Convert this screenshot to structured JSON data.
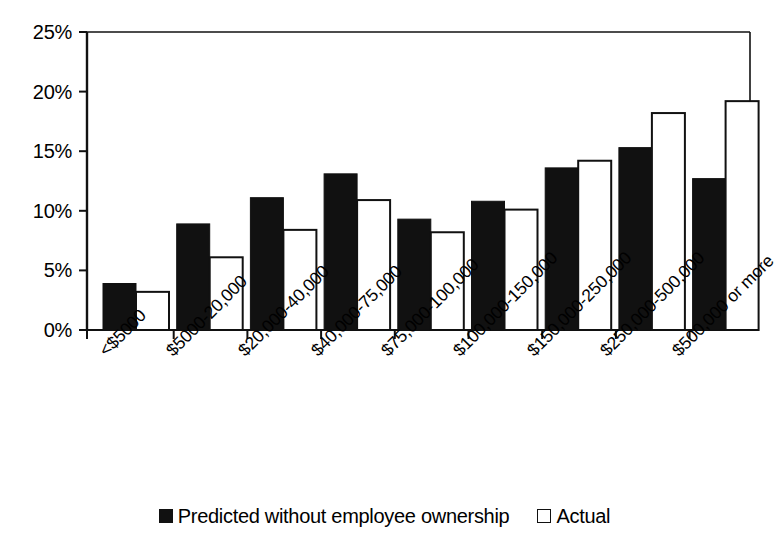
{
  "chart_data": {
    "type": "bar",
    "title": "",
    "subtitle": "",
    "xlabel": "",
    "ylabel": "",
    "ylim": [
      0,
      25
    ],
    "y_unit": "%",
    "grid": false,
    "legend_position": "bottom",
    "categories": [
      "<$5000",
      "$5000-20,000",
      "$20,000-40,000",
      "$40,000-75,000",
      "$75,000-100,000",
      "$100,000-150,000",
      "$150,000-250,000",
      "$250,000-500,000",
      "$500,000 or more"
    ],
    "series": [
      {
        "name": "Predicted without employee ownership",
        "color": "#111111",
        "style": "filled",
        "values": [
          3.9,
          8.9,
          11.1,
          13.1,
          9.3,
          10.8,
          13.6,
          15.3,
          12.7
        ]
      },
      {
        "name": "Actual",
        "color": "#ffffff",
        "style": "hollow",
        "values": [
          3.2,
          6.1,
          8.4,
          10.9,
          8.2,
          10.1,
          14.2,
          18.2,
          19.2
        ]
      }
    ],
    "y_ticks": [
      {
        "value": 0,
        "label": "0%"
      },
      {
        "value": 5,
        "label": "5%"
      },
      {
        "value": 10,
        "label": "10%"
      },
      {
        "value": 15,
        "label": "15%"
      },
      {
        "value": 20,
        "label": "20%"
      },
      {
        "value": 25,
        "label": "25%"
      }
    ]
  },
  "legend": {
    "entries": [
      {
        "label": "Predicted without employee ownership",
        "style": "filled"
      },
      {
        "label": "Actual",
        "style": "hollow"
      }
    ]
  },
  "axis": {
    "y_tick_labels": [
      "0%",
      "5%",
      "10%",
      "15%",
      "20%",
      "25%"
    ],
    "x_tick_labels": [
      "<$5000",
      "$5000-20,000",
      "$20,000-40,000",
      "$40,000-75,000",
      "$75,000-100,000",
      "$100,000-150,000",
      "$150,000-250,000",
      "$250,000-500,000",
      "$500,000 or more"
    ]
  }
}
